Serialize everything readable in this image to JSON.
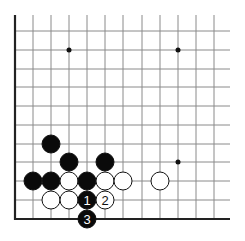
{
  "diagram": {
    "type": "go-board-corner",
    "grid": {
      "cols_x": [
        15,
        33,
        51,
        69,
        87,
        105,
        123,
        142,
        160,
        178,
        196,
        214
      ],
      "rows_y": [
        31,
        50,
        69,
        87,
        106,
        125,
        144,
        162,
        181,
        200,
        219
      ],
      "top": 15,
      "right": 230,
      "left_edge_x": 15,
      "bottom_edge_y": 219,
      "line_color": "#8a8a8a",
      "edge_color": "#222222"
    },
    "hoshi": [
      {
        "x": 69,
        "y": 50
      },
      {
        "x": 178,
        "y": 50
      },
      {
        "x": 178,
        "y": 162
      }
    ],
    "stones": [
      {
        "color": "black",
        "x": 51,
        "y": 144,
        "label": ""
      },
      {
        "color": "black",
        "x": 69,
        "y": 162,
        "label": ""
      },
      {
        "color": "black",
        "x": 105,
        "y": 162,
        "label": ""
      },
      {
        "color": "black",
        "x": 33,
        "y": 181,
        "label": ""
      },
      {
        "color": "black",
        "x": 51,
        "y": 181,
        "label": ""
      },
      {
        "color": "white",
        "x": 69,
        "y": 181,
        "label": ""
      },
      {
        "color": "black",
        "x": 87,
        "y": 181,
        "label": ""
      },
      {
        "color": "white",
        "x": 105,
        "y": 181,
        "label": ""
      },
      {
        "color": "white",
        "x": 123,
        "y": 181,
        "label": ""
      },
      {
        "color": "white",
        "x": 160,
        "y": 181,
        "label": ""
      },
      {
        "color": "white",
        "x": 51,
        "y": 200,
        "label": ""
      },
      {
        "color": "white",
        "x": 69,
        "y": 200,
        "label": ""
      },
      {
        "color": "black",
        "x": 87,
        "y": 200,
        "label": "1"
      },
      {
        "color": "white",
        "x": 105,
        "y": 200,
        "label": "2"
      },
      {
        "color": "black",
        "x": 87,
        "y": 219,
        "label": "3"
      }
    ],
    "stone_radius": 9
  }
}
